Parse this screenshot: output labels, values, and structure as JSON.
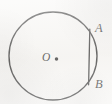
{
  "figure": {
    "kind": "geometry-diagram",
    "canvas": {
      "width": 112,
      "height": 104
    },
    "background_color": "#f8f7f5",
    "stroke_color": "#2b2b2b",
    "labels": {
      "center": "O",
      "chord_top": "A",
      "chord_bottom": "B"
    },
    "elements": {
      "circle": {
        "name": "circle",
        "center_x": 53,
        "center_y": 56,
        "radius": 44,
        "stroke_width": 1.35,
        "fill": "none"
      },
      "center_dot": {
        "name": "center-point",
        "x": 56.5,
        "y": 59,
        "radius": 1.7
      },
      "chord": {
        "name": "chord-AB",
        "x1": 89.8,
        "y1": 29.2,
        "x2": 88.6,
        "y2": 84.8,
        "stroke_width": 1.3
      },
      "point_a": {
        "name": "point-A",
        "x": 89.8,
        "y": 29.2
      },
      "point_b": {
        "name": "point-B",
        "x": 88.6,
        "y": 84.8
      }
    }
  }
}
